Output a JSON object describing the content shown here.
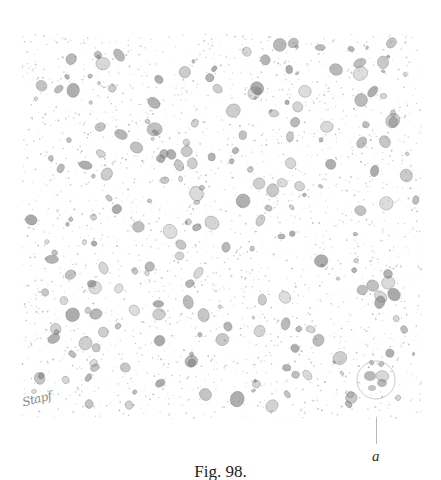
{
  "figure": {
    "caption": "Fig. 98.",
    "label": "a",
    "signature": "Stapf",
    "colors": {
      "background": "#ffffff",
      "stipple": "#9a9a9a",
      "cells": "#7d7d7d",
      "text": "#222222"
    }
  }
}
